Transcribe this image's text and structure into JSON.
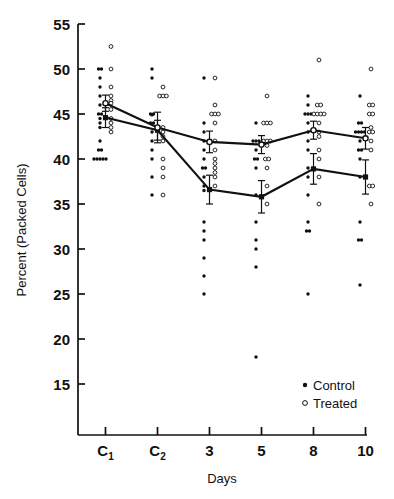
{
  "chart_data": {
    "type": "scatter",
    "title": "",
    "subtitle": "",
    "xlabel": "Days",
    "ylabel": "Percent (Packed Cells)",
    "categories": [
      "C1",
      "C2",
      "3",
      "5",
      "8",
      "10"
    ],
    "category_labels": [
      {
        "base": "C",
        "sub": "1"
      },
      {
        "base": "C",
        "sub": "2"
      },
      {
        "base": "3",
        "sub": ""
      },
      {
        "base": "5",
        "sub": ""
      },
      {
        "base": "8",
        "sub": ""
      },
      {
        "base": "10",
        "sub": ""
      }
    ],
    "xlim": [
      -0.55,
      5.55
    ],
    "ylim": [
      12.2,
      56.5
    ],
    "yticks": [
      15,
      20,
      25,
      30,
      35,
      40,
      45,
      50,
      55
    ],
    "ytick_labels": [
      "15",
      "20",
      "25",
      "30",
      "35",
      "40",
      "45",
      "50",
      "55"
    ],
    "grid": false,
    "legend_position": "bottom-right",
    "legend": [
      {
        "name": "Control",
        "marker": "filled-circle",
        "color": "#000000"
      },
      {
        "name": "Treated",
        "marker": "open-circle",
        "color": "#000000"
      }
    ],
    "series": [
      {
        "name": "Control",
        "marker": "filled-circle",
        "color": "#000000",
        "mean_line": true,
        "values": [
          44.6,
          43.2,
          36.6,
          35.8,
          38.9,
          38.0
        ],
        "errors": [
          1.1,
          1.1,
          1.6,
          1.8,
          1.7,
          1.9
        ],
        "raw_points": [
          [
            50.0,
            50.0,
            49.0,
            48.0,
            47.0,
            46.0,
            45.0,
            45.0,
            44.5,
            44.0,
            43.5,
            42.0,
            41.0,
            41.0,
            40.0,
            40.0,
            40.0,
            40.0,
            40.0
          ],
          [
            50.0,
            49.0,
            45.0,
            45.0,
            44.9,
            44.0,
            44.0,
            43.0,
            42.0,
            41.0,
            40.0,
            38.0,
            36.0
          ],
          [
            49.0,
            44.0,
            43.0,
            42.0,
            41.0,
            40.0,
            39.0,
            39.0,
            38.0,
            37.0,
            36.5,
            33.0,
            32.0,
            31.0,
            29.0,
            27.0,
            25.0
          ],
          [
            44.0,
            42.0,
            42.0,
            42.0,
            41.0,
            40.0,
            40.0,
            39.0,
            36.0,
            33.0,
            31.0,
            30.0,
            28.0,
            18.0
          ],
          [
            47.0,
            46.0,
            45.0,
            45.0,
            45.0,
            44.0,
            43.0,
            42.0,
            41.0,
            39.0,
            38.0,
            36.0,
            33.0,
            32.0,
            32.0,
            25.0
          ],
          [
            47.0,
            44.0,
            44.0,
            43.0,
            43.0,
            43.0,
            43.0,
            42.0,
            41.0,
            41.0,
            40.0,
            38.0,
            33.0,
            31.0,
            31.0,
            26.0
          ]
        ]
      },
      {
        "name": "Treated",
        "marker": "open-circle",
        "color": "#000000",
        "mean_line": true,
        "values": [
          46.2,
          43.5,
          41.9,
          41.6,
          43.2,
          42.3
        ],
        "errors": [
          0.9,
          1.7,
          1.2,
          1.0,
          1.0,
          1.2
        ],
        "raw_points": [
          [
            52.5,
            50.0,
            48.0,
            47.0,
            46.5,
            46.2,
            45.5,
            44.5,
            44.0,
            43.5,
            43.0
          ],
          [
            48.0,
            47.0,
            47.0,
            47.0,
            43.5,
            43.0,
            42.5,
            42.0,
            40.0,
            39.0,
            38.0,
            36.0
          ],
          [
            49.0,
            46.0,
            45.0,
            45.0,
            45.0,
            44.0,
            42.0,
            41.0,
            40.0,
            39.5,
            39.0,
            38.5,
            38.0,
            37.0
          ],
          [
            47.0,
            44.0,
            44.0,
            44.0,
            42.0,
            42.0,
            42.0,
            41.5,
            40.0,
            40.0,
            39.0,
            37.0,
            35.0
          ],
          [
            51.0,
            46.0,
            46.0,
            45.0,
            45.0,
            45.0,
            45.0,
            44.0,
            43.0,
            42.5,
            41.0,
            40.0,
            38.0,
            35.0
          ],
          [
            50.0,
            46.0,
            46.0,
            45.0,
            45.0,
            43.5,
            43.0,
            43.0,
            42.0,
            41.0,
            37.0,
            37.0,
            35.0
          ]
        ]
      }
    ]
  },
  "axes": {
    "y_label": "Percent (Packed Cells)",
    "x_label": "Days"
  },
  "legend": {
    "control_label": "Control",
    "treated_label": "Treated"
  },
  "colors": {
    "ink": "#111111",
    "background": "#ffffff"
  }
}
